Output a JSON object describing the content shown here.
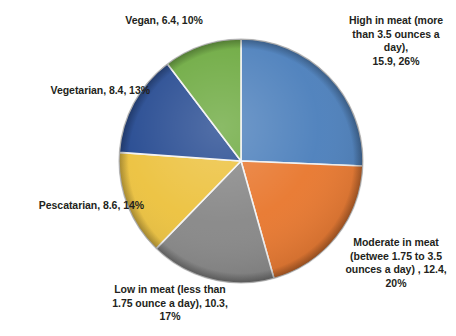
{
  "chart_data": {
    "type": "pie",
    "title": "",
    "categories": [
      "High in meat (more than 3.5 ounces a day)",
      "Moderate in meat (betwee 1.75 to 3.5 ounces a day)",
      "Low in meat (less than 1.75 ounce a day)",
      "Pescatarian",
      "Vegetarian",
      "Vegan"
    ],
    "values": [
      15.9,
      12.4,
      10.3,
      8.6,
      8.4,
      6.4
    ],
    "percentages": [
      26,
      20,
      17,
      14,
      13,
      10
    ],
    "colors": [
      "#4a7ebb",
      "#e8762c",
      "#868686",
      "#ecc13c",
      "#22478f",
      "#6aa83c"
    ],
    "legend": "none",
    "labels_position": "outside",
    "start_angle_deg": 0,
    "direction": "clockwise",
    "slices": [
      {
        "name": "high-in-meat",
        "label": "High in meat (more\nthan 3.5 ounces a day),\n15.9, 26%",
        "value": 15.9,
        "percent": 26,
        "color": "#4a7ebb"
      },
      {
        "name": "moderate-in-meat",
        "label": "Moderate in meat\n(betwee 1.75 to 3.5\nounces a day) , 12.4,\n20%",
        "value": 12.4,
        "percent": 20,
        "color": "#e8762c"
      },
      {
        "name": "low-in-meat",
        "label": "Low in meat (less than\n1.75 ounce a day), 10.3,\n17%",
        "value": 10.3,
        "percent": 17,
        "color": "#868686"
      },
      {
        "name": "pescatarian",
        "label": "Pescatarian, 8.6, 14%",
        "value": 8.6,
        "percent": 14,
        "color": "#ecc13c"
      },
      {
        "name": "vegetarian",
        "label": "Vegetarian, 8.4, 13%",
        "value": 8.4,
        "percent": 13,
        "color": "#22478f"
      },
      {
        "name": "vegan",
        "label": "Vegan, 6.4, 10%",
        "value": 6.4,
        "percent": 10,
        "color": "#6aa83c"
      }
    ]
  }
}
